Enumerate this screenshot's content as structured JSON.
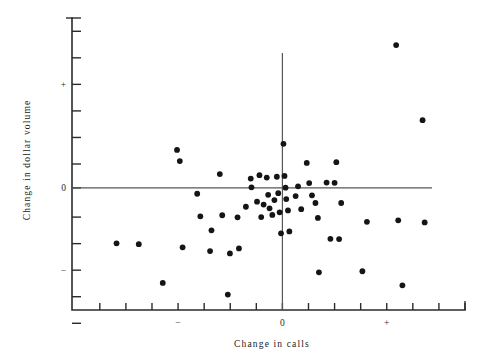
{
  "chart_data": {
    "type": "scatter",
    "title": "",
    "xlabel": "Change in calls",
    "ylabel": "Change in dollar volume",
    "grid": false,
    "legend": null,
    "xlim": [
      -5.8,
      5.5
    ],
    "ylim": [
      -4.6,
      6.4
    ],
    "x_tick_labels": [
      "",
      "",
      "",
      "−",
      "",
      "",
      "",
      "0",
      "",
      "",
      "",
      "+",
      "",
      "",
      ""
    ],
    "y_tick_labels": [
      "",
      "",
      "+",
      "",
      "",
      "",
      "0",
      "",
      "",
      "−",
      "",
      ""
    ],
    "x_tick_values": [
      -5,
      -4.25,
      -3.5,
      -2.75,
      -2,
      -1.25,
      -0.5,
      0.25,
      1,
      1.75,
      2.5,
      3.25,
      4,
      4.75,
      5.5
    ],
    "y_tick_values": [
      5.9,
      4.9,
      3.9,
      2.9,
      1.9,
      0.9,
      0,
      -1.1,
      -2.1,
      -3.1,
      -4.1,
      -5.1
    ],
    "reference_lines": {
      "horizontal_y": 0,
      "vertical_x": 0.25
    },
    "points": [
      {
        "x": -4.52,
        "y": -2.09
      },
      {
        "x": -3.88,
        "y": -2.12
      },
      {
        "x": -3.19,
        "y": -3.58
      },
      {
        "x": -2.78,
        "y": 1.43
      },
      {
        "x": -2.62,
        "y": -2.24
      },
      {
        "x": -2.7,
        "y": 1.01
      },
      {
        "x": -2.2,
        "y": -0.22
      },
      {
        "x": -2.11,
        "y": -1.07
      },
      {
        "x": -1.79,
        "y": -1.6
      },
      {
        "x": -1.83,
        "y": -2.38
      },
      {
        "x": -1.55,
        "y": 0.52
      },
      {
        "x": -1.48,
        "y": -1.03
      },
      {
        "x": -1.32,
        "y": -4.02
      },
      {
        "x": -1.26,
        "y": -2.47
      },
      {
        "x": -1.04,
        "y": -1.11
      },
      {
        "x": -1.0,
        "y": -2.28
      },
      {
        "x": -0.8,
        "y": -0.71
      },
      {
        "x": -0.66,
        "y": 0.35
      },
      {
        "x": -0.64,
        "y": 0.02
      },
      {
        "x": -0.48,
        "y": -0.52
      },
      {
        "x": -0.41,
        "y": 0.48
      },
      {
        "x": -0.36,
        "y": -1.1
      },
      {
        "x": -0.29,
        "y": -0.63
      },
      {
        "x": -0.2,
        "y": 0.39
      },
      {
        "x": -0.16,
        "y": -0.26
      },
      {
        "x": -0.12,
        "y": -0.77
      },
      {
        "x": -0.04,
        "y": -1.02
      },
      {
        "x": 0.02,
        "y": -0.46
      },
      {
        "x": 0.09,
        "y": 0.42
      },
      {
        "x": 0.13,
        "y": -0.2
      },
      {
        "x": 0.17,
        "y": -0.92
      },
      {
        "x": 0.21,
        "y": -1.71
      },
      {
        "x": 0.28,
        "y": 1.66
      },
      {
        "x": 0.31,
        "y": 0.45
      },
      {
        "x": 0.34,
        "y": 0.01
      },
      {
        "x": 0.36,
        "y": -0.42
      },
      {
        "x": 0.41,
        "y": -0.85
      },
      {
        "x": 0.45,
        "y": -1.64
      },
      {
        "x": 0.63,
        "y": -0.31
      },
      {
        "x": 0.7,
        "y": 0.06
      },
      {
        "x": 0.79,
        "y": -0.8
      },
      {
        "x": 0.95,
        "y": 0.94
      },
      {
        "x": 1.02,
        "y": 0.18
      },
      {
        "x": 1.1,
        "y": -0.28
      },
      {
        "x": 1.2,
        "y": -0.57
      },
      {
        "x": 1.27,
        "y": -1.13
      },
      {
        "x": 1.52,
        "y": 0.2
      },
      {
        "x": 1.75,
        "y": 0.19
      },
      {
        "x": 1.8,
        "y": 0.97
      },
      {
        "x": 1.88,
        "y": -1.93
      },
      {
        "x": 1.94,
        "y": -0.57
      },
      {
        "x": 1.63,
        "y": -1.92
      },
      {
        "x": 1.3,
        "y": -3.18
      },
      {
        "x": 2.68,
        "y": -1.28
      },
      {
        "x": 2.55,
        "y": -3.14
      },
      {
        "x": 3.52,
        "y": 5.38
      },
      {
        "x": 3.58,
        "y": -1.22
      },
      {
        "x": 3.7,
        "y": -3.67
      },
      {
        "x": 4.28,
        "y": 2.55
      },
      {
        "x": 4.34,
        "y": -1.3
      }
    ]
  }
}
